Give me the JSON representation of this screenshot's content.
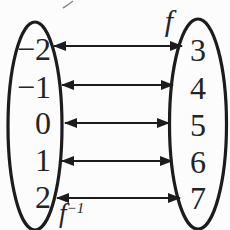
{
  "diagram": {
    "kind": "function-mapping",
    "labels": {
      "function": "f",
      "inverse_base": "f",
      "inverse_exponent": "−1"
    },
    "left_set": {
      "elements": [
        "−2",
        "−1",
        "0",
        "1",
        "2"
      ]
    },
    "right_set": {
      "elements": [
        "3",
        "4",
        "5",
        "6",
        "7"
      ]
    },
    "mappings": [
      {
        "from": "−2",
        "to": "3"
      },
      {
        "from": "−1",
        "to": "4"
      },
      {
        "from": "0",
        "to": "5"
      },
      {
        "from": "1",
        "to": "6"
      },
      {
        "from": "2",
        "to": "7"
      }
    ],
    "arrow_style": "double-headed",
    "colors": {
      "ink": "#1c1c1c",
      "text": "#242424",
      "background": "#fcfcfc"
    }
  }
}
